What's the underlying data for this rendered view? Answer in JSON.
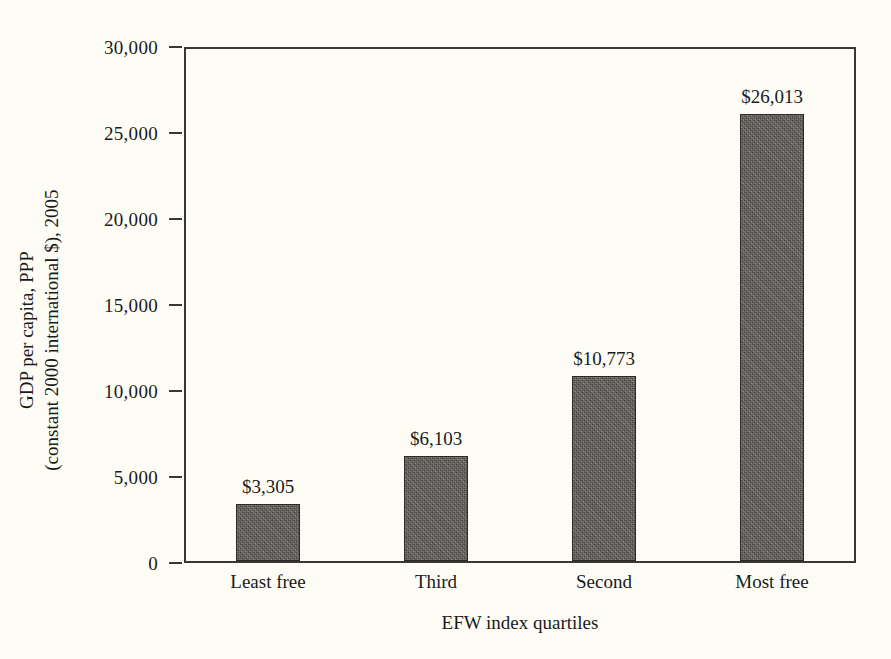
{
  "chart_data": {
    "type": "bar",
    "title": "",
    "xlabel": "EFW index quartiles",
    "ylabel_line1": "GDP per capita, PPP",
    "ylabel_line2": "(constant 2000 international $), 2005",
    "categories": [
      "Least free",
      "Third",
      "Second",
      "Most free"
    ],
    "values": [
      3305,
      6103,
      10773,
      26013
    ],
    "value_labels": [
      "$3,305",
      "$6,103",
      "$10,773",
      "$26,013"
    ],
    "ylim": [
      0,
      30000
    ],
    "ytick_values": [
      0,
      5000,
      10000,
      15000,
      20000,
      25000,
      30000
    ],
    "ytick_labels": [
      "0",
      "5,000",
      "10,000",
      "15,000",
      "20,000",
      "25,000",
      "30,000"
    ],
    "grid": false,
    "legend": false,
    "legend_position": "none",
    "colors": {
      "bar_fill": "#5e5c58",
      "bar_edge": "#2b2926",
      "axis": "#3a3733",
      "background": "#fdfdf6",
      "text": "#1a1a1a"
    }
  }
}
